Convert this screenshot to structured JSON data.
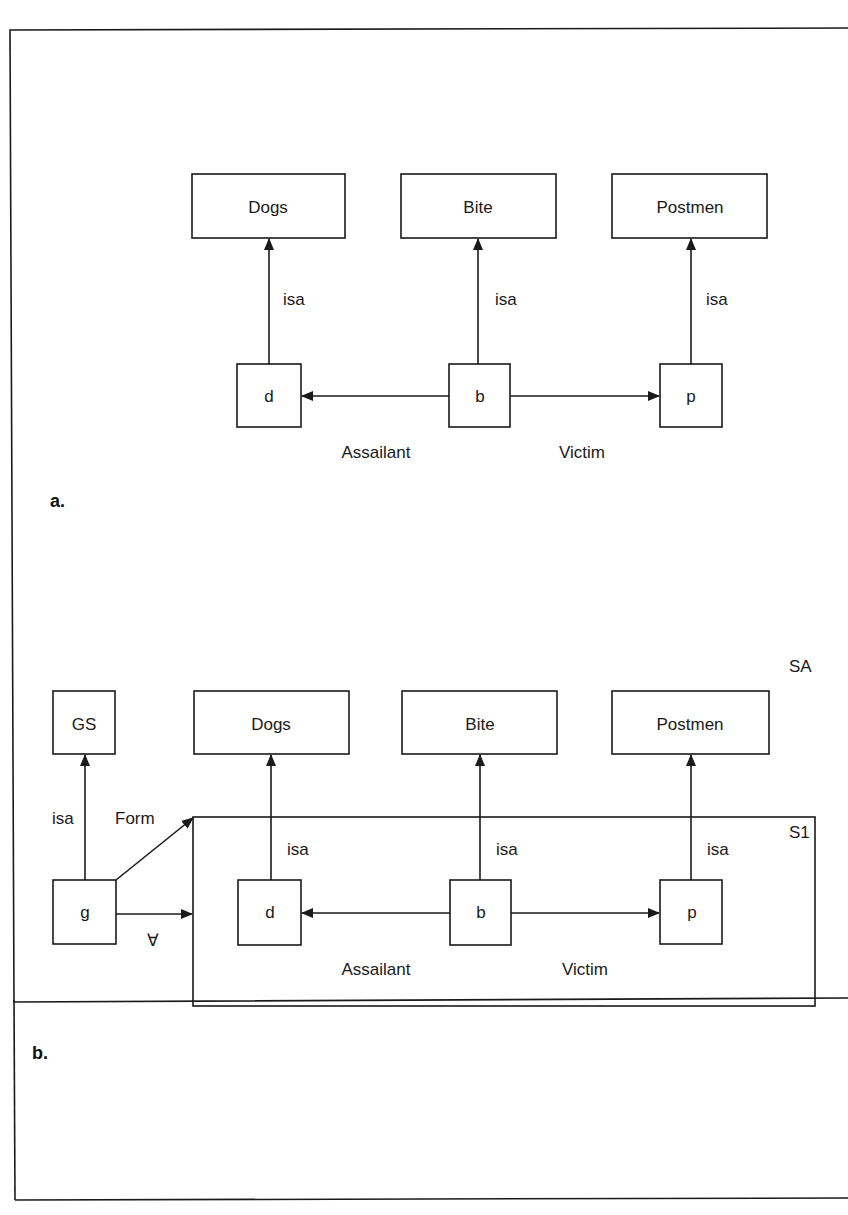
{
  "figure": {
    "panel_a": {
      "label": "a.",
      "types": [
        "Dogs",
        "Bite",
        "Postmen"
      ],
      "instances": [
        "d",
        "b",
        "p"
      ],
      "isa_label": "isa",
      "relations": {
        "assailant": "Assailant",
        "victim": "Victim"
      }
    },
    "panel_b": {
      "label": "b.",
      "space_label": "SA",
      "subspace_label": "S1",
      "gs_box": "GS",
      "g_node": "g",
      "form_label": "Form",
      "forall_label": "∀",
      "types": [
        "Dogs",
        "Bite",
        "Postmen"
      ],
      "instances": [
        "d",
        "b",
        "p"
      ],
      "isa_label": "isa",
      "relations": {
        "assailant": "Assailant",
        "victim": "Victim"
      }
    }
  }
}
